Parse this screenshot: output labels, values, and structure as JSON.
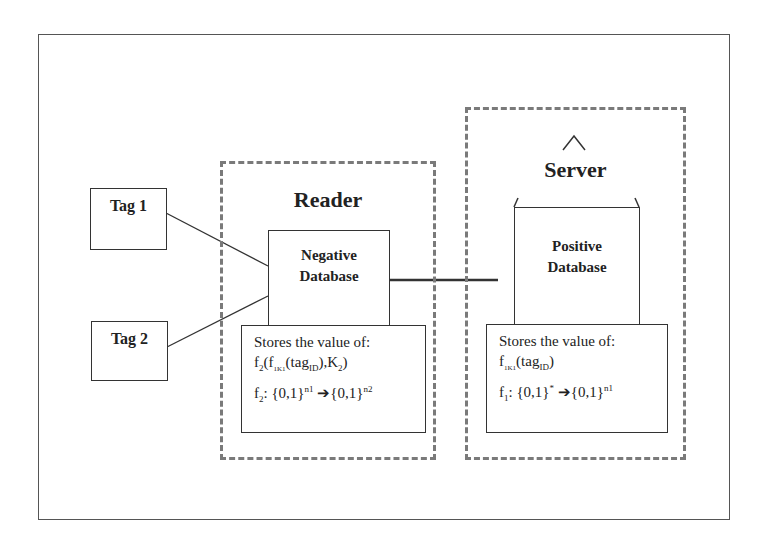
{
  "diagram": {
    "tags": [
      {
        "label": "Tag 1"
      },
      {
        "label": "Tag 2"
      }
    ],
    "reader": {
      "title": "Reader",
      "database": {
        "line1": "Negative",
        "line2": "Database"
      },
      "store": {
        "heading": "Stores the value of:",
        "expr1": {
          "f": "f",
          "f_sub": "2",
          "open": "(f",
          "k_sub": "1K1",
          "tag": "(tag",
          "id_sub": "ID",
          "close": "),K",
          "k2_sub": "2",
          "end": ")"
        },
        "expr2": {
          "f": "f",
          "f_sub": "2",
          "domain": ": {0,1}",
          "domain_sup": "n1",
          "arrow": "➔",
          "range": "{0,1}",
          "range_sup": "n2"
        }
      }
    },
    "server": {
      "title": "Server",
      "database": {
        "line1": "Positive",
        "line2": "Database"
      },
      "store": {
        "heading": "Stores the value of:",
        "expr1": {
          "f": "f",
          "k_sub": "1K1",
          "tag": "(tag",
          "id_sub": "ID",
          "end": ")"
        },
        "expr2": {
          "f": "f",
          "f_sub": "1",
          "domain": ": {0,1}",
          "domain_sup": "*",
          "arrow": "➔",
          "range": "{0,1}",
          "range_sup": "n1"
        }
      }
    },
    "colors": {
      "dashed": "#7a7a7a",
      "line": "#333333",
      "frame": "#555555"
    }
  }
}
